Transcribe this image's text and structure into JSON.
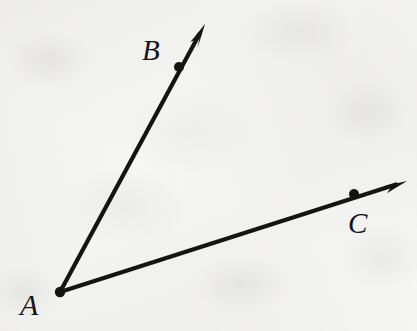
{
  "figure": {
    "kind": "geometry-diagram",
    "background_color": "#f6f6f4",
    "ink_color": "#141414",
    "width": 417,
    "height": 331,
    "labels": [
      {
        "id": "A",
        "text": "A",
        "x": 20,
        "y": 290,
        "font_size": 30
      },
      {
        "id": "B",
        "text": "B",
        "x": 142,
        "y": 36,
        "font_size": 29
      },
      {
        "id": "C",
        "text": "C",
        "x": 348,
        "y": 209,
        "font_size": 29
      }
    ],
    "points": [
      {
        "id": "A",
        "label": "A",
        "x": 60,
        "y": 292,
        "radius": 5.2,
        "role": "vertex"
      },
      {
        "id": "B",
        "label": "B",
        "x": 179,
        "y": 67,
        "radius": 5.0,
        "role": "ray-point"
      },
      {
        "id": "C",
        "label": "C",
        "x": 354,
        "y": 194,
        "radius": 5.0,
        "role": "ray-point"
      }
    ],
    "rays": [
      {
        "id": "ray-AB",
        "name": "ray-ab",
        "from": "A",
        "through": "B",
        "start_x": 60,
        "start_y": 292,
        "tip_x": 205,
        "tip_y": 24,
        "stroke_width": 4.2,
        "arrowhead": "barbed"
      },
      {
        "id": "ray-AC",
        "name": "ray-ac",
        "from": "A",
        "through": "C",
        "start_x": 60,
        "start_y": 292,
        "tip_x": 407,
        "tip_y": 181,
        "stroke_width": 4.2,
        "arrowhead": "barbed"
      }
    ]
  }
}
